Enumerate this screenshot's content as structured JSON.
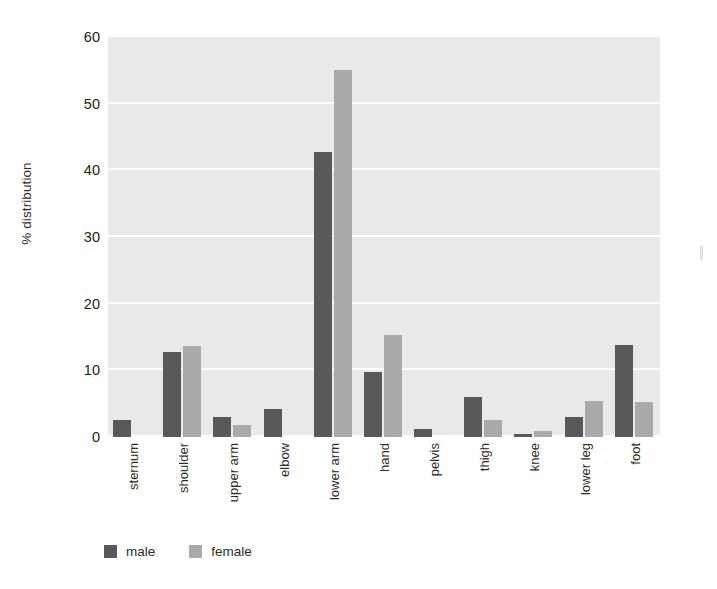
{
  "chart_data": {
    "type": "bar",
    "title": "",
    "xlabel": "",
    "ylabel": "% distribution",
    "ylim": [
      0,
      60
    ],
    "yticks": [
      0,
      10,
      20,
      30,
      40,
      50,
      60
    ],
    "grid": true,
    "legend_position": "bottom-left",
    "categories": [
      "sternum",
      "shoulder",
      "upper arm",
      "elbow",
      "lower arm",
      "hand",
      "pelvis",
      "thigh",
      "knee",
      "lower leg",
      "foot"
    ],
    "series": [
      {
        "name": "male",
        "color": "#595959",
        "values": [
          2.5,
          12.8,
          3.0,
          4.2,
          42.7,
          9.7,
          1.2,
          6.0,
          0.5,
          3.0,
          13.8
        ]
      },
      {
        "name": "female",
        "color": "#a9a9a9",
        "values": [
          0,
          13.6,
          1.8,
          0,
          55.0,
          15.3,
          0,
          2.5,
          0.9,
          5.4,
          5.2
        ]
      }
    ]
  },
  "axis": {
    "y_title": "% distribution",
    "tick_labels": [
      "0",
      "10",
      "20",
      "30",
      "40",
      "50",
      "60"
    ]
  },
  "legend": {
    "items": [
      {
        "label": "male",
        "color": "#595959"
      },
      {
        "label": "female",
        "color": "#a9a9a9"
      }
    ]
  },
  "colors": {
    "male": "#595959",
    "female": "#a9a9a9",
    "plot_background": "#e9e9e9",
    "gridline": "#fdfdfd",
    "page_background": "#ffffff",
    "text": "#2b2b2b"
  }
}
